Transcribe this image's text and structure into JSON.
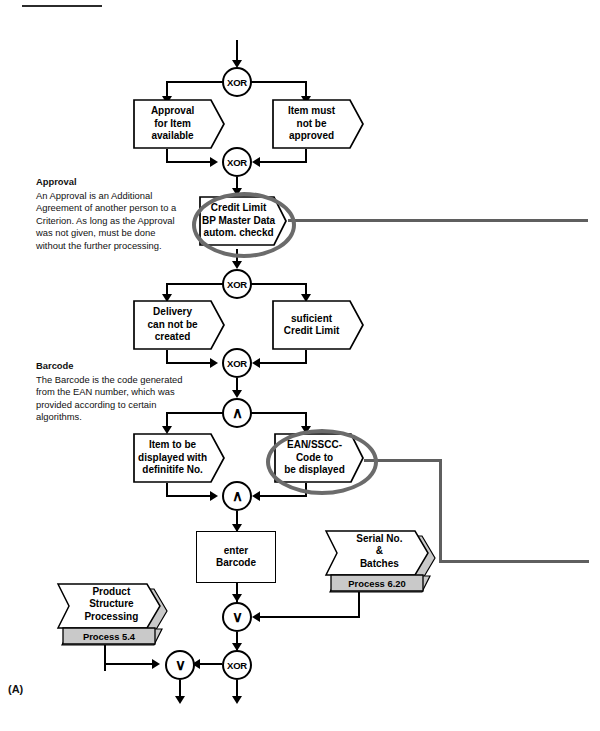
{
  "diagram": {
    "type": "epc-event-driven-process-chain",
    "corner_label": "(A)",
    "annotations": [
      {
        "id": "approval",
        "heading": "Approval",
        "body": "An Approval is an Additional Agreement of another person to a Criterion. As long as the Approval was not given, must be done without the further processing."
      },
      {
        "id": "barcode",
        "heading": "Barcode",
        "body": "The Barcode is the code generated from the EAN number, which was provided according to certain algorithms."
      }
    ],
    "connectors": [
      {
        "id": "xor-1",
        "label": "XOR",
        "kind": "xor"
      },
      {
        "id": "xor-2",
        "label": "XOR",
        "kind": "xor"
      },
      {
        "id": "xor-3",
        "label": "XOR",
        "kind": "xor"
      },
      {
        "id": "xor-4",
        "label": "XOR",
        "kind": "xor"
      },
      {
        "id": "and-1",
        "label": "∧",
        "kind": "and"
      },
      {
        "id": "and-2",
        "label": "∧",
        "kind": "and"
      },
      {
        "id": "or-1",
        "label": "∨",
        "kind": "or"
      },
      {
        "id": "or-2",
        "label": "∨",
        "kind": "or"
      },
      {
        "id": "xor-5",
        "label": "XOR",
        "kind": "xor"
      }
    ],
    "events": [
      {
        "id": "approval-for-item-available",
        "label": "Approval\nfor Item\navailable"
      },
      {
        "id": "item-must-not-be-approved",
        "label": "Item must\nnot be\napproved"
      },
      {
        "id": "delivery-can-not-be-created",
        "label": "Delivery\ncan not be\ncreated"
      },
      {
        "id": "suficient-credit-limit",
        "label": "suficient\nCredit Limit"
      },
      {
        "id": "credit-limit-bp-master-data",
        "label": "Credit Limit\nBP Master Data\nautom. checkd",
        "highlighted": true
      },
      {
        "id": "item-to-be-displayed",
        "label": "Item to be\ndisplayed with\ndefinitife No."
      },
      {
        "id": "ean-sscc-code-to-be-displayed",
        "label": "EAN/SSCC-\nCode to\nbe displayed",
        "highlighted": true
      }
    ],
    "functions": [
      {
        "id": "enter-barcode",
        "label": "enter\nBarcode"
      }
    ],
    "process_interfaces": [
      {
        "id": "serial-no-batches",
        "label": "Serial No.\n&\nBatches",
        "process": "Process 6.20"
      },
      {
        "id": "product-structure-processing",
        "label": "Product\nStructure\nProcessing",
        "process": "Process 5.4"
      }
    ],
    "event_lines": {
      "approval-for-item-available": [
        "Approval",
        "for Item",
        "available"
      ],
      "item-must-not-be-approved": [
        "Item must",
        "not be",
        "approved"
      ],
      "delivery-can-not-be-created": [
        "Delivery",
        "can not be",
        "created"
      ],
      "suficient-credit-limit": [
        "suficient",
        "Credit Limit"
      ],
      "credit-limit-bp-master-data": [
        "Credit Limit",
        "BP Master Data",
        "autom. checkd"
      ],
      "item-to-be-displayed": [
        "Item to be",
        "displayed with",
        "definitife No."
      ],
      "ean-sscc-code-to-be-displayed": [
        "EAN/SSCC-",
        "Code to",
        "be displayed"
      ],
      "enter-barcode": [
        "enter",
        "Barcode"
      ],
      "serial-no-batches": [
        "Serial No.",
        "&",
        "Batches"
      ],
      "product-structure-processing": [
        "Product",
        "Structure",
        "Processing"
      ]
    },
    "colors": {
      "line": "#000000",
      "highlight": "#6b6b6b",
      "banner": "#c9c9c9",
      "shadow": "#c9c9c9"
    }
  }
}
